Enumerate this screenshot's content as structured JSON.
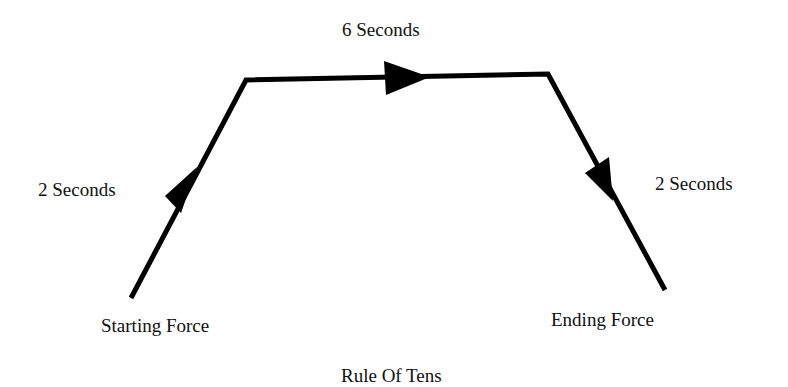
{
  "diagram": {
    "title": "Rule Of Tens",
    "phases": [
      {
        "label": "2 Seconds",
        "direction": "up"
      },
      {
        "label": "6 Seconds",
        "direction": "right"
      },
      {
        "label": "2 Seconds",
        "direction": "down"
      }
    ],
    "start_label": "Starting Force",
    "end_label": "Ending Force",
    "line_color": "#000000"
  }
}
